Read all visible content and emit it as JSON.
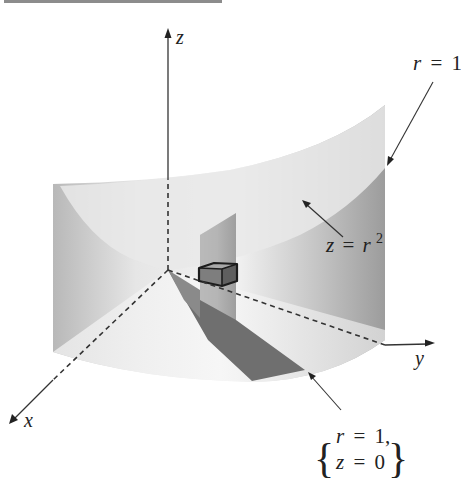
{
  "figure": {
    "axes": {
      "x_label": "x",
      "y_label": "y",
      "z_label": "z"
    },
    "annotations": {
      "cylinder": {
        "lhs": "r",
        "eq": "=",
        "rhs": "1"
      },
      "paraboloid": {
        "lhs": "z",
        "eq": "=",
        "base": "r",
        "exp": "2"
      },
      "base_curve": {
        "line1": {
          "lhs": "r",
          "eq": "=",
          "rhs": "1,"
        },
        "line2": {
          "lhs": "z",
          "eq": "=",
          "rhs": "0"
        }
      }
    },
    "colors": {
      "surface_light": "#efefef",
      "surface_mid": "#c8c8c8",
      "surface_dark": "#9a9a9a",
      "shadow": "#6e6e6e",
      "axis": "#333333",
      "top_rule": "#8c8c8c"
    }
  }
}
